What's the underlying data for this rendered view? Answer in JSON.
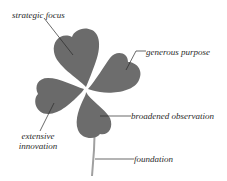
{
  "diagram": {
    "colors": {
      "leaf": "#6d6d6d",
      "leaf_shadow": "#5c5c5c",
      "leader_line": "#2a2a2a",
      "stem": "#9a9a9a",
      "background": "#ffffff"
    },
    "labels": {
      "top_leaf": "strategic focus",
      "right_leaf": "generous purpose",
      "left_leaf_line1": "extensive",
      "left_leaf_line2": "innovation",
      "bottom_leaf": "broadened observation",
      "stem": "foundation"
    }
  }
}
